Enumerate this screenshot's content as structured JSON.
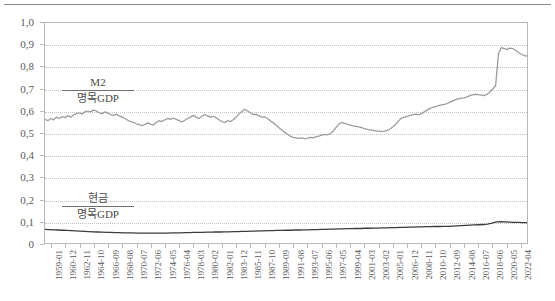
{
  "chart_data": {
    "type": "line",
    "title": "",
    "xlabel": "",
    "ylabel": "",
    "ylim": [
      0,
      1.0
    ],
    "grid": true,
    "legend_position": "inline-annotation",
    "y_tick_labels": [
      "1,0",
      "0,9",
      "0,8",
      "0,7",
      "0,6",
      "0,5",
      "0,4",
      "0,3",
      "0,2",
      "0,1",
      "0"
    ],
    "y_tick_values": [
      1.0,
      0.9,
      0.8,
      0.7,
      0.6,
      0.5,
      0.4,
      0.3,
      0.2,
      0.1,
      0
    ],
    "x_tick_labels": [
      "1959-01",
      "1960-12",
      "1962-11",
      "1964-10",
      "1966-09",
      "1968-08",
      "1970-07",
      "1972-06",
      "1974-05",
      "1976-04",
      "1978-03",
      "1980-02",
      "1982-01",
      "1983-12",
      "1985-11",
      "1987-10",
      "1989-09",
      "1991-08",
      "1993-07",
      "1995-06",
      "1997-05",
      "1999-04",
      "2001-03",
      "2003-02",
      "2005-01",
      "2006-12",
      "2008-11",
      "2010-10",
      "2012-09",
      "2014-08",
      "2016-07",
      "2018-06",
      "2020-05",
      "2022-04"
    ],
    "annotations": [
      {
        "name": "m2-ratio",
        "numerator": "M2",
        "denominator": "명목GDP"
      },
      {
        "name": "cash-ratio",
        "numerator": "현금",
        "denominator": "명목GDP"
      }
    ],
    "series": [
      {
        "name": "M2 / 명목GDP",
        "color": "#9c9c9c",
        "width": 1.3,
        "x": [
          0,
          1,
          2,
          3,
          4,
          5,
          6,
          7,
          8,
          9,
          10,
          11,
          12,
          13,
          14,
          15,
          16,
          17,
          18,
          19,
          20,
          21,
          22,
          23,
          24,
          25,
          26,
          27,
          28,
          29,
          30,
          31,
          32,
          33,
          34,
          35,
          36,
          37,
          38,
          39,
          40,
          41,
          42,
          43,
          44,
          45,
          46,
          47,
          48,
          49,
          50,
          51,
          52,
          53,
          54,
          55,
          56,
          57,
          58,
          59,
          60,
          61,
          62,
          63,
          64,
          65,
          66,
          67,
          68,
          69,
          70,
          71,
          72,
          73,
          74,
          75,
          76,
          77,
          78,
          79,
          80,
          81,
          82,
          83,
          84,
          85,
          86,
          87,
          88,
          89,
          90,
          91,
          92,
          93,
          94,
          95,
          96,
          97,
          98,
          99,
          100
        ],
        "values": [
          0.562,
          0.556,
          0.566,
          0.56,
          0.572,
          0.566,
          0.574,
          0.57,
          0.578,
          0.572,
          0.582,
          0.588,
          0.592,
          0.586,
          0.596,
          0.6,
          0.596,
          0.604,
          0.6,
          0.592,
          0.588,
          0.596,
          0.59,
          0.584,
          0.58,
          0.586,
          0.578,
          0.572,
          0.566,
          0.558,
          0.552,
          0.548,
          0.542,
          0.538,
          0.534,
          0.538,
          0.546,
          0.54,
          0.536,
          0.548,
          0.556,
          0.552,
          0.56,
          0.566,
          0.562,
          0.568,
          0.562,
          0.556,
          0.55,
          0.558,
          0.566,
          0.572,
          0.58,
          0.572,
          0.566,
          0.576,
          0.584,
          0.578,
          0.572,
          0.576,
          0.57,
          0.56,
          0.552,
          0.548,
          0.556,
          0.552,
          0.56,
          0.572,
          0.586,
          0.598,
          0.608,
          0.6,
          0.592,
          0.584,
          0.586,
          0.578,
          0.572,
          0.574,
          0.566,
          0.556,
          0.546,
          0.536,
          0.524,
          0.514,
          0.504,
          0.494,
          0.486,
          0.48,
          0.478,
          0.476,
          0.478,
          0.474,
          0.476,
          0.48,
          0.478,
          0.482,
          0.486,
          0.49,
          0.494,
          0.492,
          0.496
        ],
        "values_tail": [
          0.508,
          0.524,
          0.54,
          0.548,
          0.544,
          0.54,
          0.536,
          0.532,
          0.53,
          0.528,
          0.524,
          0.52,
          0.516,
          0.514,
          0.512,
          0.51,
          0.508,
          0.506,
          0.508,
          0.512,
          0.518,
          0.528,
          0.54,
          0.556,
          0.568,
          0.572,
          0.576,
          0.58,
          0.584,
          0.586,
          0.584,
          0.588,
          0.596,
          0.604,
          0.612,
          0.616,
          0.62,
          0.624,
          0.628,
          0.63,
          0.634,
          0.64,
          0.646,
          0.652,
          0.656,
          0.658,
          0.66,
          0.664,
          0.67,
          0.674,
          0.676,
          0.674,
          0.672,
          0.67,
          0.676,
          0.686,
          0.7,
          0.716,
          0.86,
          0.888,
          0.884,
          0.88,
          0.886,
          0.884,
          0.876,
          0.866,
          0.858,
          0.852,
          0.85
        ]
      },
      {
        "name": "현금 / 명목GDP",
        "color": "#3c3c3c",
        "width": 1.3,
        "values": [
          0.062,
          0.061,
          0.06,
          0.059,
          0.058,
          0.057,
          0.056,
          0.055,
          0.054,
          0.053,
          0.052,
          0.051,
          0.05,
          0.049,
          0.048,
          0.048,
          0.047,
          0.047,
          0.046,
          0.046,
          0.046,
          0.045,
          0.045,
          0.045,
          0.045,
          0.045,
          0.045,
          0.045,
          0.045,
          0.046,
          0.046,
          0.046,
          0.047,
          0.047,
          0.048,
          0.048,
          0.048,
          0.049,
          0.049,
          0.05,
          0.05,
          0.051,
          0.051,
          0.052,
          0.052,
          0.053,
          0.053,
          0.054,
          0.054,
          0.055,
          0.055,
          0.056,
          0.056,
          0.057,
          0.057,
          0.058,
          0.058,
          0.059,
          0.059,
          0.06,
          0.06,
          0.061,
          0.061,
          0.062,
          0.062,
          0.063,
          0.063,
          0.064,
          0.064,
          0.065,
          0.065,
          0.066,
          0.066,
          0.067,
          0.067,
          0.068,
          0.068,
          0.069,
          0.069,
          0.07,
          0.07,
          0.071,
          0.071,
          0.072,
          0.072,
          0.073,
          0.073,
          0.074,
          0.074,
          0.075,
          0.075,
          0.076,
          0.076,
          0.077,
          0.078,
          0.079,
          0.08,
          0.081,
          0.082,
          0.083,
          0.084,
          0.086,
          0.09,
          0.096,
          0.097,
          0.096,
          0.095,
          0.094,
          0.094,
          0.093,
          0.093
        ]
      }
    ]
  }
}
